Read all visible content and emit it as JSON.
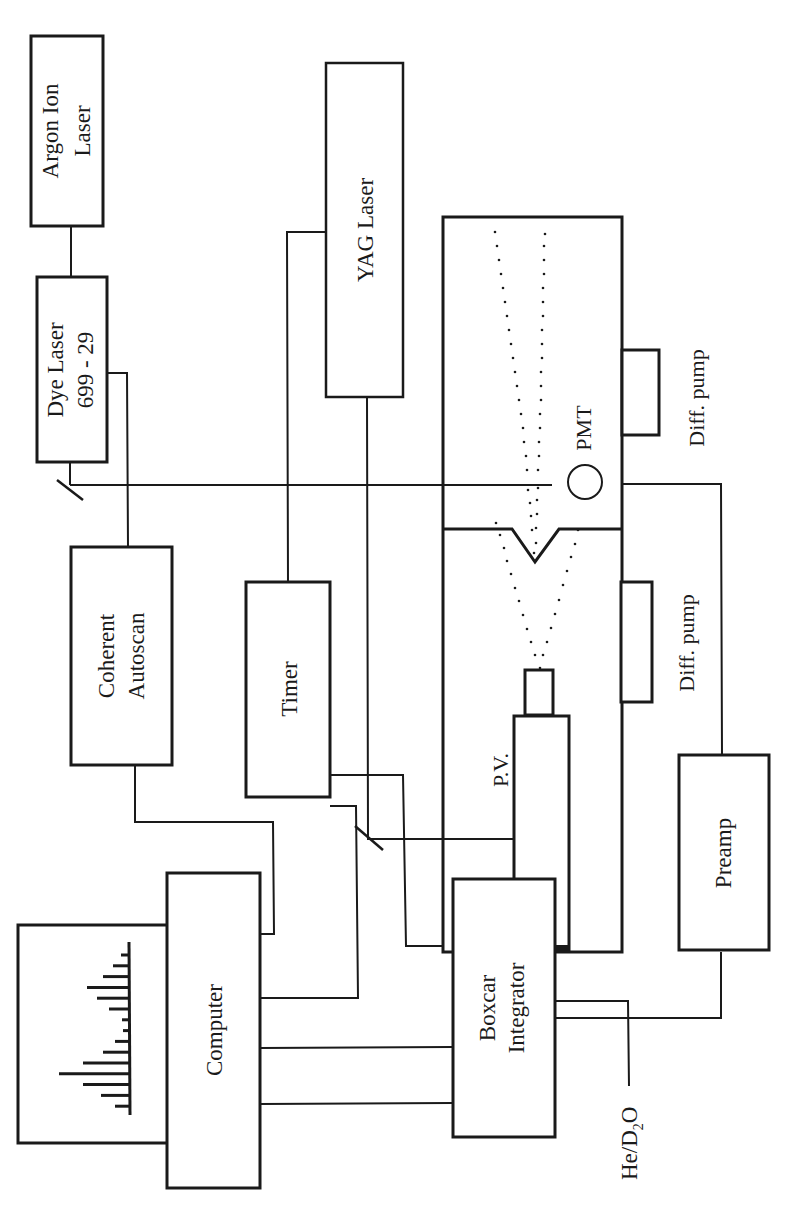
{
  "diagram": {
    "orientation": "rotated-90-ccw",
    "components": {
      "argon_laser": {
        "line1": "Argon Ion",
        "line2": "Laser"
      },
      "dye_laser": {
        "line1": "Dye Laser",
        "line2": "699 - 29"
      },
      "yag_laser": {
        "label": "YAG Laser"
      },
      "coherent_autoscan": {
        "line1": "Coherent",
        "line2": "Autoscan"
      },
      "timer": {
        "label": "Timer"
      },
      "computer": {
        "label": "Computer"
      },
      "boxcar_integrator": {
        "line1": "Boxcar",
        "line2": "Integrator"
      },
      "preamp": {
        "label": "Preamp"
      },
      "pmt": {
        "label": "PMT"
      },
      "pulsed_valve": {
        "label": "P.V."
      },
      "diff_pump_1": {
        "label": "Diff. pump"
      },
      "diff_pump_2": {
        "label": "Diff. pump"
      },
      "gas_inlet": {
        "prefix": "He/D",
        "subscript": "2",
        "suffix": "O"
      }
    },
    "spectrum_display": {
      "bar_lengths": [
        8,
        16,
        26,
        42,
        32,
        20,
        7,
        6,
        14,
        26,
        46,
        70,
        46,
        28,
        14
      ]
    },
    "colors": {
      "line": "#1a1a1a",
      "background": "#ffffff"
    }
  }
}
